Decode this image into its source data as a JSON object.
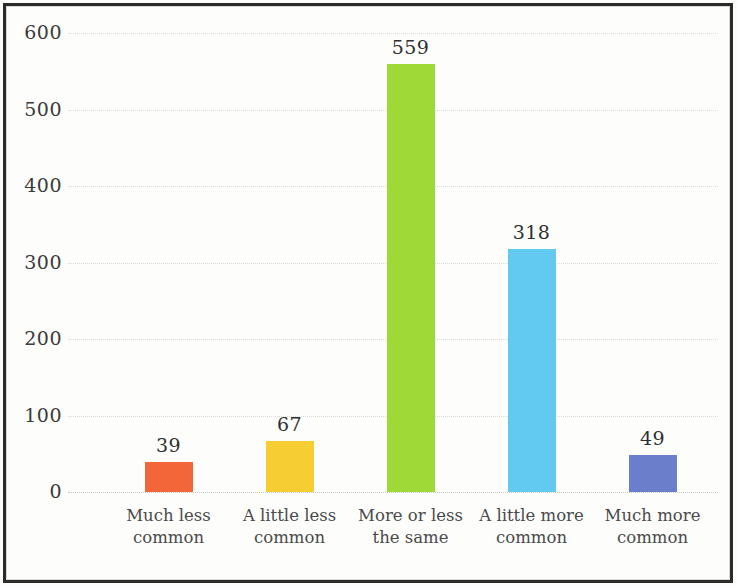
{
  "chart_data": {
    "type": "bar",
    "title": "",
    "subtitle": "",
    "xlabel": "",
    "ylabel": "",
    "categories": [
      "Much less common",
      "A little less common",
      "More or less the same",
      "A little more common",
      "Much more common"
    ],
    "category_lines": [
      [
        "Much less",
        "common"
      ],
      [
        "A little less",
        "common"
      ],
      [
        "More or less",
        "the same"
      ],
      [
        "A little more",
        "common"
      ],
      [
        "Much more",
        "common"
      ]
    ],
    "values": [
      39,
      67,
      559,
      318,
      49
    ],
    "value_labels": [
      "39",
      "67",
      "559",
      "318",
      "49"
    ],
    "bar_colors": [
      "#F2663A",
      "#F6CE33",
      "#9ED938",
      "#62C9F0",
      "#6B7ECB"
    ],
    "ylim": [
      0,
      600
    ],
    "yticks": [
      600,
      500,
      400,
      300,
      200,
      100,
      0
    ],
    "ytick_labels": [
      "600",
      "500",
      "400",
      "300",
      "200",
      "100",
      "0"
    ],
    "grid": true,
    "grid_axis": "y",
    "legend": false,
    "legend_position": "none",
    "colors": {
      "background": "#FDFDFC",
      "frame_border": "#2B2B2B",
      "gridline": "#DCDCD8",
      "tick_text": "#3A3A3A",
      "label_text": "#4A4A4A",
      "value_text": "#2F2F2F"
    }
  }
}
